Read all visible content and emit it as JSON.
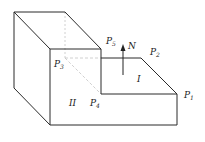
{
  "figure": {
    "points": [
      {
        "id": "P1",
        "label": "P",
        "sub": "1",
        "x": 184,
        "y": 98
      },
      {
        "id": "P2",
        "label": "P",
        "sub": "2",
        "x": 150,
        "y": 55
      },
      {
        "id": "P3",
        "label": "P",
        "sub": "3",
        "x": 54,
        "y": 67
      },
      {
        "id": "P4",
        "label": "P",
        "sub": "4",
        "x": 90,
        "y": 106
      },
      {
        "id": "P5",
        "label": "P",
        "sub": "5",
        "x": 106,
        "y": 44
      }
    ],
    "normal": {
      "label": "N"
    },
    "faces": [
      {
        "id": "I",
        "label": "I"
      },
      {
        "id": "II",
        "label": "II"
      }
    ],
    "colors": {
      "line": "#2a2a2a",
      "hidden": "#bdbdbd",
      "background": "#ffffff"
    }
  }
}
